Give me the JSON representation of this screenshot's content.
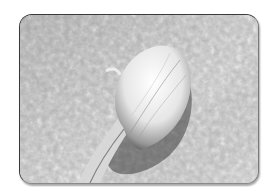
{
  "image": {
    "description": "Grayscale scanning electron micrograph of an oval cell body with a tapering tail on a textured surface",
    "alt": "SEM micrograph",
    "colors": {
      "background": "#c8c8c8",
      "cell_highlight": "#f4f4f4",
      "shadow": "#3c3c3c",
      "frame_border": "#3a3a3a"
    }
  }
}
